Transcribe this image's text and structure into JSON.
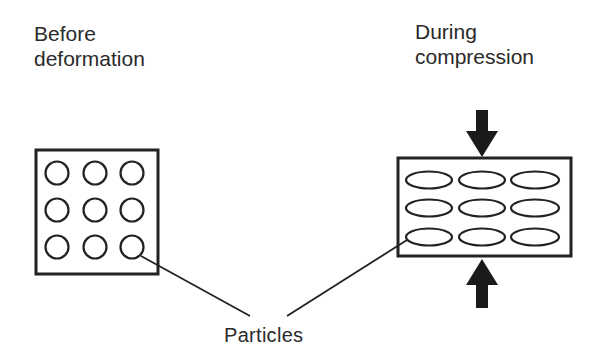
{
  "diagram": {
    "type": "schematic",
    "panels": [
      {
        "title_line1": "Before",
        "title_line2": "deformation",
        "particle_shape": "circle",
        "grid": {
          "rows": 3,
          "cols": 3
        }
      },
      {
        "title_line1": "During",
        "title_line2": "compression",
        "particle_shape": "ellipse",
        "grid": {
          "rows": 3,
          "cols": 3
        },
        "arrows": [
          "down-arrow-top",
          "up-arrow-bottom"
        ]
      }
    ],
    "callout_label": "Particles",
    "colors": {
      "stroke": "#222222",
      "text": "#2a2a2a",
      "background": "#ffffff"
    }
  }
}
